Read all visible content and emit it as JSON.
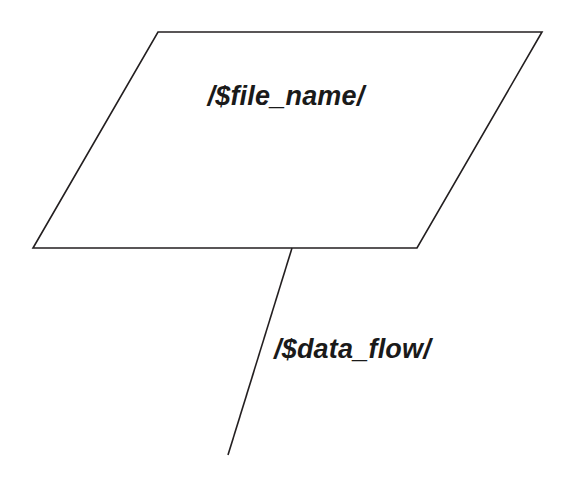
{
  "diagram": {
    "type": "data-flow-diagram",
    "background_color": "#ffffff",
    "stroke_color": "#231f20",
    "text_color": "#1a1a1a",
    "nodes": [
      {
        "id": "file-store",
        "shape": "parallelogram",
        "label": "/$file_name/",
        "points": "158,32 542,32 417,248 33,248",
        "label_x": 286,
        "label_y": 105
      }
    ],
    "edges": [
      {
        "id": "data-flow-edge",
        "shape": "line",
        "label": "/$data_flow/",
        "x1": 292,
        "y1": 248,
        "x2": 228,
        "y2": 455,
        "label_x": 274,
        "label_y": 358
      }
    ]
  }
}
